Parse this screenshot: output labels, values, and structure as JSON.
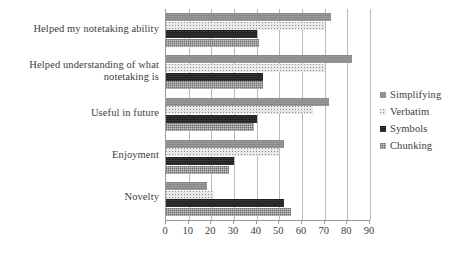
{
  "chart_data": {
    "type": "bar",
    "orientation": "horizontal",
    "title": "",
    "xlabel": "",
    "ylabel": "",
    "xlim": [
      0,
      90
    ],
    "xticks": [
      0,
      10,
      20,
      30,
      40,
      50,
      60,
      70,
      80,
      90
    ],
    "grid": true,
    "legend_position": "right",
    "categories": [
      "Helped my notetaking ability",
      "Helped understanding of what notetaking is",
      "Useful in future",
      "Enjoyment",
      "Novelty"
    ],
    "series": [
      {
        "name": "Simplifying",
        "color": "#8f8f8f",
        "pattern": "solid-gray",
        "values": [
          73,
          82,
          72,
          52,
          18
        ]
      },
      {
        "name": "Verbatim",
        "color": "#e9e9e9",
        "pattern": "light-dotted",
        "values": [
          70,
          70,
          65,
          50,
          21
        ]
      },
      {
        "name": "Symbols",
        "color": "#272727",
        "pattern": "solid-black",
        "values": [
          40,
          43,
          40,
          30,
          52
        ]
      },
      {
        "name": "Chunking",
        "color": "#9d9d9d",
        "pattern": "textured-gray",
        "values": [
          41,
          43,
          39,
          28,
          55
        ]
      }
    ]
  },
  "legend": {
    "items": [
      {
        "label": "Simplifying"
      },
      {
        "label": "Verbatim"
      },
      {
        "label": "Symbols"
      },
      {
        "label": "Chunking"
      }
    ]
  }
}
